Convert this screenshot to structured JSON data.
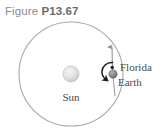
{
  "caption": {
    "prefix": "Figure",
    "number": "P13.67"
  },
  "diagram": {
    "type": "physics-orbit-diagram",
    "labels": {
      "sun": "Sun",
      "earth": "Earth",
      "florida": "Florida"
    },
    "colors": {
      "orbit_stroke": "#a8a8a8",
      "sun_fill": "#d9d9d9",
      "sun_highlight": "#f2f2f2",
      "earth_fill": "#8c8c8c",
      "florida_dot": "#1a1a1a",
      "arrow_stroke": "#8a8a8a",
      "rotation_arrow": "#1a1a1a",
      "label_text": "#4a4a4a",
      "caption_word": "#8d8d8d",
      "caption_number": "#6a6a6a",
      "background": "#ffffff"
    },
    "geometry": {
      "orbit_center_x": 71,
      "orbit_center_y": 74,
      "orbit_radius": 52,
      "sun_radius": 8,
      "earth_x": 113,
      "earth_y": 74,
      "earth_radius": 4,
      "florida_x": 112,
      "florida_y": 67,
      "florida_radius": 1.6,
      "axis_arrow_top_y": 44
    }
  }
}
